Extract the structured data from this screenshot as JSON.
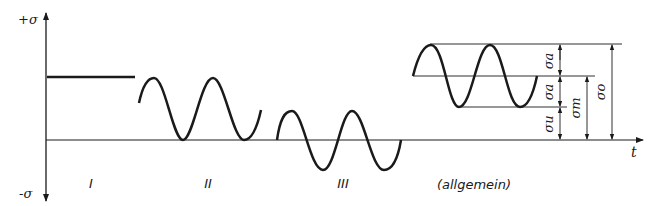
{
  "axes": {
    "y_top_label": "+σ",
    "y_bottom_label": "-σ",
    "x_label": "t"
  },
  "cases": [
    {
      "id": "I",
      "label": "I",
      "kind": "constant"
    },
    {
      "id": "II",
      "label": "II",
      "kind": "pulsating (above zero)"
    },
    {
      "id": "III",
      "label": "III",
      "kind": "alternating"
    },
    {
      "id": "general",
      "label": "(allgemein)",
      "kind": "general"
    }
  ],
  "dimensions": {
    "sigma_a_upper": "σa",
    "sigma_a_lower": "σa",
    "sigma_u": "σu",
    "sigma_m": "σm",
    "sigma_o": "σo"
  },
  "colors": {
    "line": "#1a1a1a",
    "background": "#ffffff"
  }
}
